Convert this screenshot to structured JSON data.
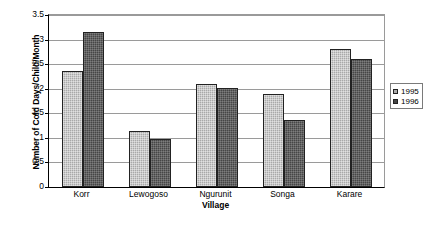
{
  "chart_data": {
    "type": "bar",
    "title": "",
    "xlabel": "Village",
    "ylabel": "Number of Cold Days/Child/Month",
    "categories": [
      "Korr",
      "Lewogoso",
      "Ngurunit",
      "Songa",
      "Karare"
    ],
    "series": [
      {
        "name": "1995",
        "color": "#a9a9a9",
        "values": [
          2.37,
          1.14,
          2.09,
          1.89,
          2.8
        ]
      },
      {
        "name": "1996",
        "color": "#464646",
        "values": [
          3.15,
          0.98,
          2.01,
          1.37,
          2.61
        ]
      }
    ],
    "ylim": [
      0,
      3.5
    ],
    "yticks": [
      "0",
      "0.5",
      "1",
      "1.5",
      "2",
      "2.5",
      "3",
      "3.5"
    ],
    "ytick_values": [
      0,
      0.5,
      1,
      1.5,
      2,
      2.5,
      3,
      3.5
    ],
    "grid": true,
    "legend_position": "right"
  }
}
